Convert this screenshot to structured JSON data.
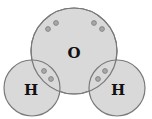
{
  "diagram": {
    "title": "",
    "atoms": [
      {
        "id": "oxygen",
        "label": "O",
        "cx": 74,
        "cy": 51,
        "r": 43
      },
      {
        "id": "hydrogen-left",
        "label": "H",
        "cx": 32,
        "cy": 88,
        "r": 28
      },
      {
        "id": "hydrogen-right",
        "label": "H",
        "cx": 117,
        "cy": 88,
        "r": 28
      }
    ],
    "colors": {
      "atom_fill": "#d9d9d9",
      "atom_stroke": "#7a7a7a",
      "electron_fill": "#a8a8a8",
      "electron_stroke": "#7a7a7a"
    }
  }
}
